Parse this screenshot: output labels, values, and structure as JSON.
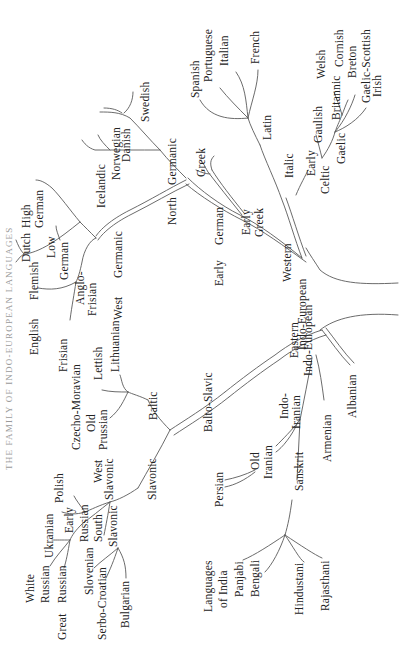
{
  "title": "THE FAMILY OF INDO-EUROPEAN LANGUAGES",
  "colors": {
    "line": "#5a5a5a",
    "text": "#222222",
    "background": "#ffffff"
  },
  "tree": {
    "root": "Indo-European",
    "western": {
      "label": "Western Indo-European",
      "celtic": {
        "label": "Early Celtic",
        "children": [
          "Gaulish",
          "Britannic",
          "Gaelic"
        ],
        "britannic": [
          "Welsh",
          "Cornish",
          "Breton"
        ],
        "gaelic": [
          "Gaelic-Scottish",
          "Irish"
        ]
      },
      "italic": {
        "label": "Italic",
        "latin": "Latin",
        "children": [
          "Spanish",
          "Portuguese",
          "Italian",
          "French"
        ]
      },
      "greek": {
        "label": "Early Greek",
        "children": [
          "Greek"
        ]
      },
      "german": {
        "label": "Early German",
        "north": {
          "label": "North Germanic",
          "children": [
            "Icelandic",
            "Norwegian",
            "Danish",
            "Swedish"
          ]
        },
        "west": {
          "label": "West Germanic",
          "anglo_frisian": {
            "label": "Anglo-Frisian",
            "children": [
              "English",
              "Frisian"
            ]
          },
          "low_german": {
            "label": "Low German",
            "children": [
              "Flemish",
              "Dutch"
            ]
          },
          "high_german": "High German"
        }
      }
    },
    "eastern": {
      "label": "Eastern Indo-European",
      "albanian": "Albanian",
      "armenian": "Armenian",
      "balto_slavic": {
        "label": "Balto-Slavic",
        "baltic": {
          "label": "Baltic",
          "children": [
            "Lithuanian",
            "Lettish",
            "Old Prussian"
          ]
        },
        "slavonic": {
          "label": "Slavonic",
          "west": {
            "label": "West Slavonic",
            "children": [
              "Czecho-Moravian",
              "Polish"
            ]
          },
          "russian": {
            "label": "Early Russian",
            "children": [
              "Ukranian",
              "White Russian",
              "Great Russian"
            ]
          },
          "south": {
            "label": "South Slavonic",
            "children": [
              "Slovenian",
              "Serbo-Croatian",
              "Bulgarian"
            ]
          }
        }
      },
      "indo_iranian": {
        "label": "Indo-Iranian",
        "iranian": {
          "label": "Old Iranian",
          "children": [
            "Persian"
          ]
        },
        "sanskrit": {
          "label": "Sanskrit",
          "group": "Languages of India",
          "children": [
            "Panjabi",
            "Bengali",
            "Hindustani",
            "Rajasthani"
          ]
        }
      }
    }
  },
  "labels": [
    {
      "id": "swedish",
      "text": "Swedish",
      "x": 140,
      "y": 122
    },
    {
      "id": "danish",
      "text": "Danish",
      "x": 121,
      "y": 162
    },
    {
      "id": "norwegian",
      "text": "Norwegian",
      "x": 111,
      "y": 180
    },
    {
      "id": "icelandic",
      "text": "Icelandic",
      "x": 96,
      "y": 208
    },
    {
      "id": "north",
      "text": "North",
      "x": 167,
      "y": 225
    },
    {
      "id": "germanic-n",
      "text": "Germanic",
      "x": 167,
      "y": 185
    },
    {
      "id": "greek",
      "text": "Greek",
      "x": 196,
      "y": 177
    },
    {
      "id": "early-german-1",
      "text": "Early",
      "x": 214,
      "y": 286
    },
    {
      "id": "early-german-2",
      "text": "German",
      "x": 214,
      "y": 245
    },
    {
      "id": "early-greek-1",
      "text": "Early",
      "x": 241,
      "y": 235
    },
    {
      "id": "early-greek-2",
      "text": "Greek",
      "x": 254,
      "y": 237
    },
    {
      "id": "western-1",
      "text": "Western",
      "x": 282,
      "y": 282
    },
    {
      "id": "western-2",
      "text": "Indo-European",
      "x": 297,
      "y": 350
    },
    {
      "id": "spanish",
      "text": "Spanish",
      "x": 190,
      "y": 98
    },
    {
      "id": "portuguese",
      "text": "Portuguese",
      "x": 203,
      "y": 82
    },
    {
      "id": "italian",
      "text": "Italian",
      "x": 219,
      "y": 66
    },
    {
      "id": "french",
      "text": "French",
      "x": 250,
      "y": 64
    },
    {
      "id": "latin",
      "text": "Latin",
      "x": 262,
      "y": 140
    },
    {
      "id": "italic",
      "text": "Italic",
      "x": 284,
      "y": 178
    },
    {
      "id": "early-celtic-1",
      "text": "Early",
      "x": 306,
      "y": 176
    },
    {
      "id": "early-celtic-2",
      "text": "Celtic",
      "x": 320,
      "y": 194
    },
    {
      "id": "gaulish",
      "text": "Gaulish",
      "x": 313,
      "y": 143
    },
    {
      "id": "gaelic",
      "text": "Gaelic",
      "x": 336,
      "y": 164
    },
    {
      "id": "britannic",
      "text": "Britannic",
      "x": 331,
      "y": 120
    },
    {
      "id": "welsh",
      "text": "Welsh",
      "x": 316,
      "y": 79
    },
    {
      "id": "cornish",
      "text": "Cornish",
      "x": 334,
      "y": 67
    },
    {
      "id": "breton",
      "text": "Breton",
      "x": 347,
      "y": 78
    },
    {
      "id": "gaelic-scottish",
      "text": "Gaelic-Scottish",
      "x": 361,
      "y": 103
    },
    {
      "id": "irish",
      "text": "Irish",
      "x": 372,
      "y": 97
    },
    {
      "id": "high-1",
      "text": "High",
      "x": 21,
      "y": 228
    },
    {
      "id": "high-2",
      "text": "German",
      "x": 34,
      "y": 228
    },
    {
      "id": "dutch",
      "text": "Dutch",
      "x": 21,
      "y": 262
    },
    {
      "id": "low-1",
      "text": "Low",
      "x": 46,
      "y": 258
    },
    {
      "id": "low-2",
      "text": "German",
      "x": 59,
      "y": 280
    },
    {
      "id": "flemish",
      "text": "Flemish",
      "x": 29,
      "y": 300
    },
    {
      "id": "english",
      "text": "English",
      "x": 29,
      "y": 355
    },
    {
      "id": "anglo-1",
      "text": "Anglo-",
      "x": 75,
      "y": 305
    },
    {
      "id": "anglo-2",
      "text": "Frisian",
      "x": 87,
      "y": 316
    },
    {
      "id": "frisian",
      "text": "Frisian",
      "x": 58,
      "y": 372
    },
    {
      "id": "west-germanic-1",
      "text": "West",
      "x": 113,
      "y": 320
    },
    {
      "id": "west-germanic-2",
      "text": "Germanic",
      "x": 113,
      "y": 278
    },
    {
      "id": "lithuanian",
      "text": "Lithuanian",
      "x": 110,
      "y": 372
    },
    {
      "id": "lettish",
      "text": "Lettish",
      "x": 93,
      "y": 380
    },
    {
      "id": "old",
      "text": "Old",
      "x": 86,
      "y": 432
    },
    {
      "id": "prussian",
      "text": "Prussian",
      "x": 98,
      "y": 450
    },
    {
      "id": "baltic",
      "text": "Baltic",
      "x": 148,
      "y": 420
    },
    {
      "id": "czecho",
      "text": "Czecho-Moravian",
      "x": 71,
      "y": 450
    },
    {
      "id": "polish",
      "text": "Polish",
      "x": 54,
      "y": 503
    },
    {
      "id": "west-sl-1",
      "text": "West",
      "x": 93,
      "y": 483
    },
    {
      "id": "west-sl-2",
      "text": "Slavonic",
      "x": 104,
      "y": 500
    },
    {
      "id": "slavonic",
      "text": "Slavonic",
      "x": 147,
      "y": 500
    },
    {
      "id": "balto-slavic",
      "text": "Balto-Slavic",
      "x": 203,
      "y": 432
    },
    {
      "id": "eastern-1",
      "text": "Eastern",
      "x": 289,
      "y": 358
    },
    {
      "id": "eastern-2",
      "text": "Indo-European",
      "x": 303,
      "y": 376
    },
    {
      "id": "albanian",
      "text": "Albanian",
      "x": 347,
      "y": 418
    },
    {
      "id": "indo-1",
      "text": "Indo-",
      "x": 279,
      "y": 419
    },
    {
      "id": "indo-2",
      "text": "Iranian",
      "x": 291,
      "y": 429
    },
    {
      "id": "armenian",
      "text": "Armenian",
      "x": 322,
      "y": 462
    },
    {
      "id": "old-ir-1",
      "text": "Old",
      "x": 250,
      "y": 470
    },
    {
      "id": "old-ir-2",
      "text": "Iranian",
      "x": 263,
      "y": 479
    },
    {
      "id": "persian",
      "text": "Persian",
      "x": 214,
      "y": 507
    },
    {
      "id": "sanskrit",
      "text": "Sanskrit",
      "x": 294,
      "y": 491
    },
    {
      "id": "early-ru-1",
      "text": "Early",
      "x": 64,
      "y": 533
    },
    {
      "id": "russian-e",
      "text": "Russian",
      "x": 79,
      "y": 542
    },
    {
      "id": "south",
      "text": "South",
      "x": 93,
      "y": 542
    },
    {
      "id": "south-sl",
      "text": "Slavonic",
      "x": 108,
      "y": 547
    },
    {
      "id": "ukranian",
      "text": "Ukranian",
      "x": 44,
      "y": 558
    },
    {
      "id": "white",
      "text": "White",
      "x": 25,
      "y": 603
    },
    {
      "id": "white-r",
      "text": "Russian",
      "x": 40,
      "y": 603
    },
    {
      "id": "great",
      "text": "Great",
      "x": 57,
      "y": 640
    },
    {
      "id": "great-r",
      "text": "Russian",
      "x": 57,
      "y": 603
    },
    {
      "id": "slovenian",
      "text": "Slovenian",
      "x": 84,
      "y": 595
    },
    {
      "id": "serbo",
      "text": "Serbo-Croatian",
      "x": 97,
      "y": 640
    },
    {
      "id": "bulgarian",
      "text": "Bulgarian",
      "x": 120,
      "y": 628
    },
    {
      "id": "lang-1",
      "text": "Languages",
      "x": 203,
      "y": 612
    },
    {
      "id": "lang-2",
      "text": "of India",
      "x": 218,
      "y": 608
    },
    {
      "id": "panjabi",
      "text": "Panjabi",
      "x": 234,
      "y": 597
    },
    {
      "id": "bengali",
      "text": "Bengali",
      "x": 250,
      "y": 597
    },
    {
      "id": "hindustani",
      "text": "Hindustani",
      "x": 294,
      "y": 615
    },
    {
      "id": "rajasthani",
      "text": "Rajasthani",
      "x": 320,
      "y": 611
    }
  ]
}
